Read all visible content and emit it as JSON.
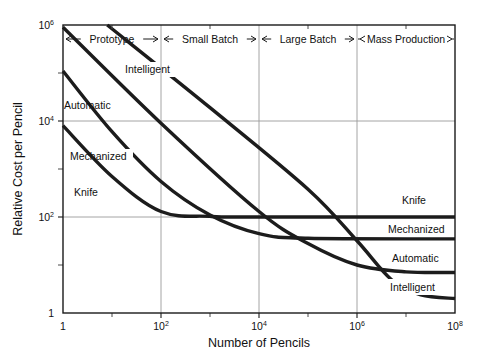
{
  "chart_data": {
    "type": "line",
    "title": "",
    "xlabel": "Number of Pencils",
    "ylabel": "Relative Cost per Pencil",
    "xscale": "log",
    "yscale": "log",
    "xlim": [
      1,
      100000000
    ],
    "ylim": [
      1,
      1000000
    ],
    "grid": true,
    "legend_position": "inline-labels",
    "xticklabels": [
      "1",
      "10",
      "10",
      "10",
      "10"
    ],
    "xtick_exponents": [
      "",
      "2",
      "4",
      "6",
      "8"
    ],
    "xticks": [
      1,
      100,
      10000,
      1000000,
      100000000
    ],
    "yticklabels": [
      "10",
      "10",
      "10",
      "1"
    ],
    "ytick_exponents": [
      "6",
      "4",
      "2",
      ""
    ],
    "yticks": [
      1000000,
      10000,
      100,
      1
    ],
    "minor_xticks": [
      10,
      1000,
      100000,
      10000000
    ],
    "minor_yticks": [
      100000,
      1000,
      10
    ],
    "regions": [
      {
        "label": "Prototype",
        "x_start": 1,
        "x_end": 100
      },
      {
        "label": "Small Batch",
        "x_start": 100,
        "x_end": 10000
      },
      {
        "label": "Large Batch",
        "x_start": 10000,
        "x_end": 1000000
      },
      {
        "label": "Mass Production",
        "x_start": 1000000,
        "x_end": 100000000
      }
    ],
    "series": [
      {
        "name": "Knife",
        "asymptote": 100,
        "left_label": "Knife",
        "right_label": "Knife",
        "points": [
          {
            "x": 1,
            "y": 8000
          },
          {
            "x": 10,
            "y": 700
          },
          {
            "x": 100,
            "y": 130
          },
          {
            "x": 1000,
            "y": 103
          },
          {
            "x": 10000,
            "y": 100
          },
          {
            "x": 100000000,
            "y": 100
          }
        ]
      },
      {
        "name": "Mechanized",
        "asymptote": 35,
        "left_label": "Mechanized",
        "right_label": "Mechanized",
        "points": [
          {
            "x": 1,
            "y": 110000
          },
          {
            "x": 10,
            "y": 6000
          },
          {
            "x": 100,
            "y": 550
          },
          {
            "x": 1000,
            "y": 110
          },
          {
            "x": 10000,
            "y": 45
          },
          {
            "x": 100000,
            "y": 36
          },
          {
            "x": 100000000,
            "y": 35
          }
        ]
      },
      {
        "name": "Automatic",
        "asymptote": 7,
        "left_label": "Automatic",
        "right_label": "Automatic",
        "points": [
          {
            "x": 1,
            "y": 900000
          },
          {
            "x": 100,
            "y": 9000
          },
          {
            "x": 10000,
            "y": 130
          },
          {
            "x": 100000,
            "y": 28
          },
          {
            "x": 1000000,
            "y": 10
          },
          {
            "x": 10000000,
            "y": 7.2
          },
          {
            "x": 100000000,
            "y": 7
          }
        ]
      },
      {
        "name": "Intelligent",
        "asymptote": 2,
        "left_label": "Intelligent",
        "right_label": "Intelligent",
        "points": [
          {
            "x": 8,
            "y": 1000000
          },
          {
            "x": 1000,
            "y": 19000
          },
          {
            "x": 100000,
            "y": 380
          },
          {
            "x": 1000000,
            "y": 32
          },
          {
            "x": 5000000,
            "y": 5
          },
          {
            "x": 20000000,
            "y": 2.4
          },
          {
            "x": 100000000,
            "y": 2
          }
        ]
      }
    ]
  },
  "axes": {
    "x_title": "Number of Pencils",
    "y_title": "Relative Cost per Pencil"
  }
}
